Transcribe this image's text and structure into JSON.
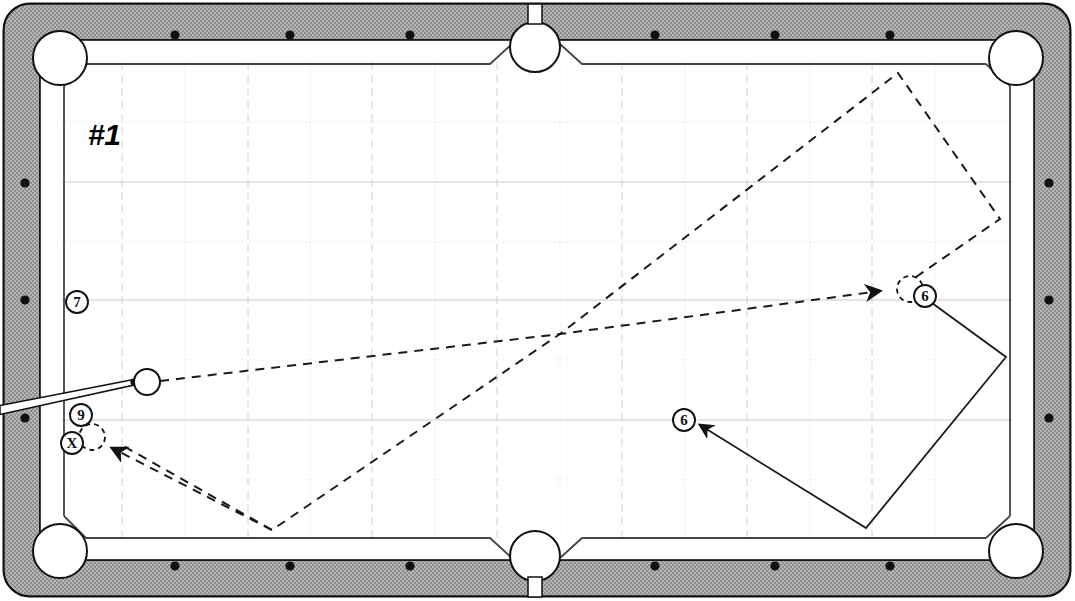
{
  "diagram": {
    "title": "#1",
    "kind": "pool-table-shot-diagram",
    "surface_color": "#ffffff",
    "rail_color": "#a9a9a9",
    "line_color": "#1a1a1a",
    "grid_color": "#cfcfcf"
  },
  "table": {
    "outer": {
      "x": 4,
      "y": 4,
      "width": 1066,
      "height": 592,
      "corner_radius": 26
    },
    "rail_band_width": 34,
    "playfield": {
      "x": 62,
      "y": 62,
      "width": 950,
      "height": 478
    },
    "pockets": [
      {
        "name": "top-left-corner",
        "cx": 60,
        "cy": 58,
        "r": 27
      },
      {
        "name": "top-side",
        "cx": 535,
        "cy": 47,
        "r": 25
      },
      {
        "name": "top-right-corner",
        "cx": 1016,
        "cy": 58,
        "r": 27
      },
      {
        "name": "bottom-left-corner",
        "cx": 60,
        "cy": 551,
        "r": 27
      },
      {
        "name": "bottom-side",
        "cx": 535,
        "cy": 556,
        "r": 25
      },
      {
        "name": "bottom-right-corner",
        "cx": 1016,
        "cy": 551,
        "r": 27
      }
    ],
    "diamonds": {
      "top": [
        {
          "x": 175,
          "y": 35
        },
        {
          "x": 290,
          "y": 35
        },
        {
          "x": 410,
          "y": 35
        },
        {
          "x": 655,
          "y": 35
        },
        {
          "x": 775,
          "y": 35
        },
        {
          "x": 890,
          "y": 35
        }
      ],
      "bottom": [
        {
          "x": 175,
          "y": 566
        },
        {
          "x": 290,
          "y": 566
        },
        {
          "x": 410,
          "y": 566
        },
        {
          "x": 655,
          "y": 566
        },
        {
          "x": 775,
          "y": 566
        },
        {
          "x": 890,
          "y": 566
        }
      ],
      "left": [
        {
          "x": 25,
          "y": 183
        },
        {
          "x": 25,
          "y": 300
        },
        {
          "x": 25,
          "y": 418
        }
      ],
      "right": [
        {
          "x": 1049,
          "y": 183
        },
        {
          "x": 1049,
          "y": 300
        },
        {
          "x": 1049,
          "y": 418
        }
      ]
    }
  },
  "grid": {
    "vertical_x": [
      122,
      185,
      248,
      310,
      372,
      435,
      497,
      560,
      622,
      685,
      747,
      810,
      872,
      935
    ],
    "horizontal_y": [
      122,
      182,
      242,
      300,
      360,
      420,
      480
    ],
    "solid_vertical_x": [
      122,
      248,
      372,
      497,
      622,
      747,
      872
    ],
    "solid_horizontal_y": [
      182,
      300,
      420
    ]
  },
  "balls": [
    {
      "name": "cue-ball",
      "label": "",
      "cx": 147,
      "cy": 382,
      "r": 13,
      "style": "solid"
    },
    {
      "name": "ball-six-target",
      "label": "",
      "cx": 910,
      "cy": 289,
      "r": 13,
      "style": "dashed"
    },
    {
      "name": "ball-nine-target",
      "label": "",
      "cx": 92,
      "cy": 437,
      "r": 13,
      "style": "dashed"
    }
  ],
  "markers": [
    {
      "name": "marker-7",
      "label": "7",
      "cx": 77,
      "cy": 302,
      "r": 11
    },
    {
      "name": "marker-9",
      "label": "9",
      "cx": 81,
      "cy": 415,
      "r": 11
    },
    {
      "name": "marker-x",
      "label": "X",
      "cx": 72,
      "cy": 443,
      "r": 11
    },
    {
      "name": "marker-6-target",
      "label": "6",
      "cx": 925,
      "cy": 296,
      "r": 11
    },
    {
      "name": "marker-6-aim",
      "label": "6",
      "cx": 684,
      "cy": 420,
      "r": 11
    }
  ],
  "cue_stick": {
    "name": "cue-stick",
    "tip_x": 135,
    "tip_y": 381,
    "butt_x": 0,
    "butt_y": 410,
    "tip_width": 3.5,
    "butt_width": 9
  },
  "paths": [
    {
      "name": "cue-ball-to-six-path",
      "style": "dashed",
      "arrow": "end",
      "points": [
        [
          160,
          381
        ],
        [
          560,
          334
        ],
        [
          880,
          291
        ]
      ]
    },
    {
      "name": "six-ball-carom-path",
      "style": "dashed",
      "arrow": "none",
      "points": [
        [
          916,
          277
        ],
        [
          1000,
          219
        ],
        [
          898,
          73
        ],
        [
          560,
          334
        ],
        [
          272,
          530
        ],
        [
          120,
          444
        ]
      ]
    },
    {
      "name": "cue-ball-to-nine-path",
      "style": "dashed",
      "arrow": "end",
      "points": [
        [
          272,
          530
        ],
        [
          112,
          448
        ]
      ]
    },
    {
      "name": "six-ball-solid-track",
      "style": "solid",
      "arrow": "end",
      "points": [
        [
          932,
          303
        ],
        [
          1006,
          357
        ],
        [
          866,
          528
        ],
        [
          700,
          425
        ]
      ]
    }
  ]
}
